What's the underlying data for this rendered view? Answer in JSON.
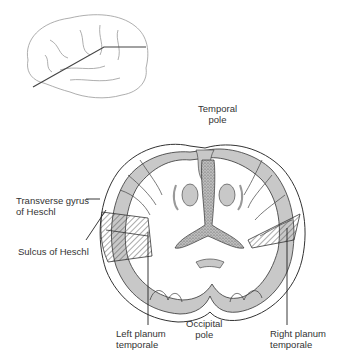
{
  "figure": {
    "type": "anatomical diagram",
    "inset": {
      "name": "lateral view of brain with section plane line"
    },
    "labels": {
      "temporal_pole": [
        "Temporal",
        "pole"
      ],
      "transverse_gyrus": [
        "Transverse gyrus",
        "of Heschl"
      ],
      "sulcus": [
        "Sulcus of Heschl"
      ],
      "left_planum": [
        "Left planum",
        "temporale"
      ],
      "occipital_pole": [
        "Occipital",
        "pole"
      ],
      "right_planum": [
        "Right planum",
        "temporale"
      ]
    },
    "colors": {
      "gray_matter": "#c8c8c8",
      "outline": "#333333",
      "ventricle_stipple": "#9a9a9a"
    }
  }
}
